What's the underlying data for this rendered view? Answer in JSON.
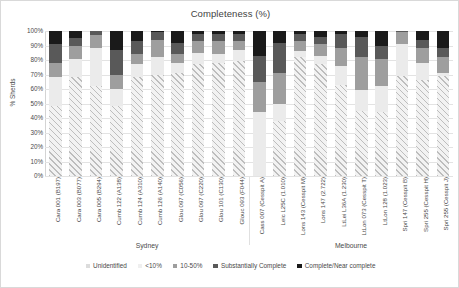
{
  "chart_data": {
    "type": "bar",
    "variant": "stacked-100-percent",
    "title": "Completeness (%)",
    "xlabel": "",
    "ylabel": "% Sherds",
    "ylim": [
      0,
      100
    ],
    "ytick_labels": [
      "0%",
      "10%",
      "20%",
      "30%",
      "40%",
      "50%",
      "60%",
      "70%",
      "80%",
      "90%",
      "100%"
    ],
    "ytick_values": [
      0,
      10,
      20,
      30,
      40,
      50,
      60,
      70,
      80,
      90,
      100
    ],
    "grid": true,
    "legend_position": "bottom",
    "categories": [
      "Cara 001 (B197)",
      "Cara 003 (B077)",
      "Cara 005 (B294)",
      "Cumb 122 (A138)",
      "Cumb 124 (A310)",
      "Cumb 126 (A140)",
      "Glou 097 (C056)",
      "Glou 097 (C220)",
      "Glou 101 (C130)",
      "Glouc 093 (F044)",
      "Cass 007 (Cesspit A)",
      "Leic L25C (1.010)",
      "Lons 143 (Cesspit M)",
      "Lons 147 (2.722)",
      "LtLei L36A (1.230)",
      "LtLon 073 (Cesspit T)",
      "LtLon 128 (1.023)",
      "Spri 147 (Cesspit B)",
      "Spri 255 (Cesspit H)",
      "Spri 255 (Cesspit J)"
    ],
    "series": [
      {
        "name": "Unidentified",
        "color": "#f2f2f2",
        "pattern": "diagonal-hatch",
        "values": [
          48,
          68,
          62,
          48,
          68,
          70,
          71,
          77,
          78,
          79,
          0,
          38,
          82,
          77,
          63,
          45,
          44,
          69,
          66,
          69
        ]
      },
      {
        "name": "<10%",
        "color": "#ebebeb",
        "pattern": "solid",
        "values": [
          20,
          13,
          26,
          12,
          9,
          12,
          7,
          8,
          6,
          8,
          44,
          12,
          4,
          6,
          13,
          14,
          18,
          22,
          12,
          2
        ]
      },
      {
        "name": "10-50%",
        "color": "#9e9e9e",
        "pattern": "solid",
        "values": [
          10,
          9,
          9,
          10,
          7,
          12,
          6,
          8,
          9,
          6,
          21,
          21,
          7,
          8,
          12,
          23,
          19,
          8,
          10,
          11
        ]
      },
      {
        "name": "Substantially Complete",
        "color": "#595959",
        "pattern": "solid",
        "values": [
          13,
          5,
          3,
          17,
          9,
          5,
          8,
          5,
          5,
          5,
          18,
          21,
          5,
          5,
          10,
          14,
          9,
          1,
          6,
          6
        ]
      },
      {
        "name": "Complete/Near complete",
        "color": "#1a1a1a",
        "pattern": "solid",
        "values": [
          9,
          5,
          0,
          13,
          7,
          1,
          8,
          2,
          2,
          2,
          17,
          8,
          2,
          4,
          2,
          4,
          10,
          0,
          6,
          12
        ]
      }
    ],
    "groups": [
      {
        "label": "Sydney",
        "start_index": 0,
        "end_index": 9
      },
      {
        "label": "Melbourne",
        "start_index": 10,
        "end_index": 19
      }
    ]
  },
  "legend": {
    "items": [
      {
        "label": "Unidentified",
        "color": "#dcdcdc"
      },
      {
        "label": "<10%",
        "color": "#efefef"
      },
      {
        "label": "10-50%",
        "color": "#9e9e9e"
      },
      {
        "label": "Substantially Complete",
        "color": "#595959"
      },
      {
        "label": "Complete/Near complete",
        "color": "#1a1a1a"
      }
    ]
  }
}
